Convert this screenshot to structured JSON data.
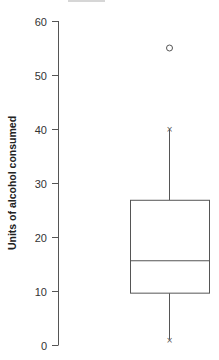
{
  "chart_data": {
    "type": "box",
    "title": "",
    "xlabel": "",
    "ylabel": "Units of alcohol consumed",
    "ylim": [
      0,
      60
    ],
    "yticks": [
      0,
      10,
      20,
      30,
      40,
      50,
      60
    ],
    "ytick_labels": [
      "0",
      "10",
      "20",
      "30",
      "40",
      "50",
      "60"
    ],
    "grid": false,
    "legend": null,
    "series": [
      {
        "name": "",
        "whisker_low": 1,
        "q1": 9.6,
        "median": 15.6,
        "q3": 26.8,
        "whisker_high": 40,
        "outliers": [
          55
        ],
        "whisker_end_marker": "x",
        "outlier_marker": "o"
      }
    ]
  },
  "colors": {
    "line": "#555555",
    "text": "#333333",
    "background": "#ffffff"
  }
}
